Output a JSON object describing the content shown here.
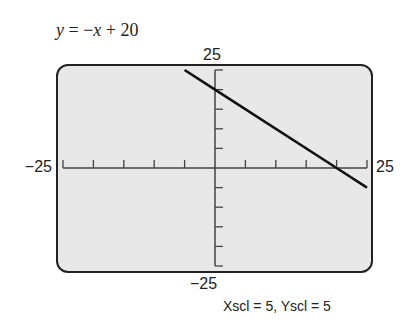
{
  "equation": {
    "var_y": "y",
    "op1": " = −",
    "var_x": "x",
    "op2": " + 20"
  },
  "labels": {
    "ymax": "25",
    "ymin": "−25",
    "xmin": "−25",
    "xmax": "25"
  },
  "caption": "Xscl = 5, Yscl = 5",
  "colors": {
    "screen_bg": "#e8e8e8",
    "frame": "#222222",
    "axis": "#444444",
    "line": "#111111"
  },
  "chart_data": {
    "type": "line",
    "title": "y = −x + 20",
    "xlabel": "",
    "ylabel": "",
    "xlim": [
      -25,
      25
    ],
    "ylim": [
      -25,
      25
    ],
    "xscl": 5,
    "yscl": 5,
    "grid": false,
    "series": [
      {
        "name": "y = -x + 20",
        "slope": -1,
        "intercept": 20,
        "x": [
          -5,
          0,
          20,
          25
        ],
        "y": [
          25,
          20,
          0,
          -5
        ]
      }
    ],
    "tick_labels": {
      "x": [
        "−25",
        "25"
      ],
      "y": [
        "−25",
        "25"
      ]
    },
    "annotation": "Xscl = 5, Yscl = 5"
  }
}
